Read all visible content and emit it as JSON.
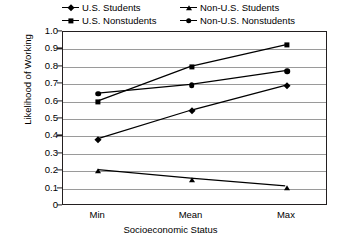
{
  "chart_data": {
    "type": "line",
    "title": "",
    "xlabel": "Socioeconomic Status",
    "ylabel": "Likelihood of Working",
    "categories": [
      "Min",
      "Mean",
      "Max"
    ],
    "ylim": [
      0,
      1.0
    ],
    "ytick_labels": [
      "1.0",
      "0.9",
      "0.8",
      "0.7",
      "0.6",
      "0.5",
      "0.4",
      "0.3",
      "0.2",
      "0.1",
      "0"
    ],
    "ytick_values": [
      1.0,
      0.9,
      0.8,
      0.7,
      0.6,
      0.5,
      0.4,
      0.3,
      0.2,
      0.1,
      0
    ],
    "grid": true,
    "legend_position": "top",
    "series": [
      {
        "name": "U.S. Students",
        "marker": "diamond",
        "values": [
          0.38,
          0.545,
          0.69
        ]
      },
      {
        "name": "U.S. Nonstudents",
        "marker": "square",
        "values": [
          0.6,
          0.8,
          0.925
        ]
      },
      {
        "name": "Non-U.S. Students",
        "marker": "triangle",
        "values": [
          0.2,
          0.15,
          0.105
        ]
      },
      {
        "name": "Non-U.S. Nonstudents",
        "marker": "circle",
        "values": [
          0.645,
          0.695,
          0.775
        ]
      }
    ]
  },
  "colors": {
    "series": "#000000",
    "grid": "#9a9a9a",
    "axis": "#231f20",
    "background": "#ffffff"
  }
}
